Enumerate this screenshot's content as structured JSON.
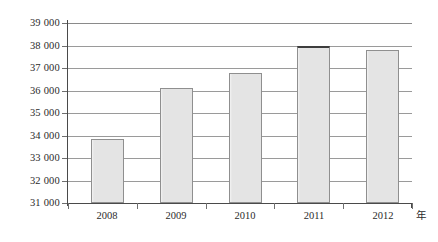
{
  "chart_data": {
    "type": "bar",
    "title": "",
    "subtitle": "",
    "xlabel": "年",
    "ylabel": "",
    "categories": [
      "2008",
      "2009",
      "2010",
      "2011",
      "2012"
    ],
    "values": [
      33850,
      36120,
      36760,
      37980,
      37780
    ],
    "series": [
      {
        "name": "",
        "values": [
          33850,
          36120,
          36760,
          37980,
          37780
        ]
      }
    ],
    "ylim": [
      31000,
      39000
    ],
    "ytick_step": 1000,
    "ytick_labels": [
      "39 000",
      "38 000",
      "37 000",
      "36 000",
      "35 000",
      "34 000",
      "33 000",
      "32 000",
      "31 000"
    ],
    "ytick_values": [
      39000,
      38000,
      37000,
      36000,
      35000,
      34000,
      33000,
      32000,
      31000
    ],
    "grid": true,
    "grid_orientation": "horizontal",
    "legend": false,
    "legend_position": "none",
    "thousands_separator": " ",
    "colors": {
      "bar_fill": "#e4e4e4",
      "bar_border": "#8f8f8f",
      "bar_border_emphasis": "#3d3d3d",
      "gridline": "#9a9a9a",
      "axis": "#4a4a4a",
      "text": "#2b2b2b",
      "background": "#ffffff"
    }
  },
  "axis_labels": {
    "y": [
      {
        "text": "39 000"
      },
      {
        "text": "38 000"
      },
      {
        "text": "37 000"
      },
      {
        "text": "36 000"
      },
      {
        "text": "35 000"
      },
      {
        "text": "34 000"
      },
      {
        "text": "33 000"
      },
      {
        "text": "32 000"
      },
      {
        "text": "31 000"
      }
    ],
    "x": [
      {
        "text": "2008"
      },
      {
        "text": "2009"
      },
      {
        "text": "2010"
      },
      {
        "text": "2011"
      },
      {
        "text": "2012"
      }
    ],
    "x_unit": "年"
  }
}
